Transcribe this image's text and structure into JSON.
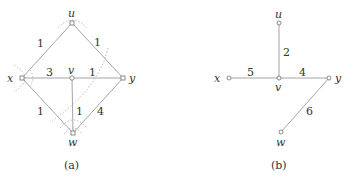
{
  "figure_a": {
    "caption": "(a)",
    "nodes": {
      "u": {
        "label": "u"
      },
      "x": {
        "label": "x"
      },
      "v": {
        "label": "v"
      },
      "y": {
        "label": "y"
      },
      "w": {
        "label": "w"
      }
    },
    "edges": [
      {
        "from": "u",
        "to": "x",
        "weight": "1"
      },
      {
        "from": "u",
        "to": "y",
        "weight": "1"
      },
      {
        "from": "x",
        "to": "v",
        "weight": "3"
      },
      {
        "from": "v",
        "to": "y",
        "weight": "1"
      },
      {
        "from": "x",
        "to": "w",
        "weight": "1"
      },
      {
        "from": "v",
        "to": "w",
        "weight": "1"
      },
      {
        "from": "y",
        "to": "w",
        "weight": "4"
      }
    ],
    "annotation": "dotted cut curve and angle arcs at u, x, w"
  },
  "figure_b": {
    "caption": "(b)",
    "nodes": {
      "u": {
        "label": "u"
      },
      "x": {
        "label": "x"
      },
      "v": {
        "label": "v"
      },
      "y": {
        "label": "y"
      },
      "w": {
        "label": "w"
      }
    },
    "edges": [
      {
        "from": "u",
        "to": "v",
        "weight": "2"
      },
      {
        "from": "x",
        "to": "v",
        "weight": "5"
      },
      {
        "from": "v",
        "to": "y",
        "weight": "4"
      },
      {
        "from": "y",
        "to": "w",
        "weight": "6"
      }
    ]
  }
}
